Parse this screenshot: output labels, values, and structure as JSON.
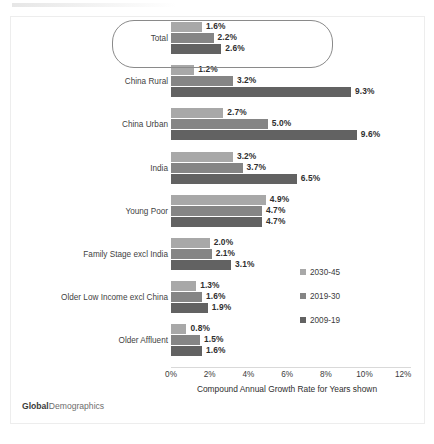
{
  "brand": {
    "part1": "Global",
    "part2": "Demographics"
  },
  "legend": {
    "position": "right-middle",
    "items": [
      {
        "label": "2030-45",
        "color": "#a8a8a8",
        "key": "s2030"
      },
      {
        "label": "2019-30",
        "color": "#858585",
        "key": "s2019"
      },
      {
        "label": "2009-19",
        "color": "#626262",
        "key": "s2009"
      }
    ]
  },
  "axis": {
    "title": "Compound Annual Growth Rate for Years shown",
    "ticks": [
      "0%",
      "2%",
      "4%",
      "6%",
      "8%",
      "10%",
      "12%"
    ]
  },
  "highlight": {
    "category": "Total",
    "shape": "rounded-rectangle"
  },
  "chart_data": {
    "type": "bar",
    "orientation": "horizontal",
    "title": "",
    "subtitle": "",
    "xlabel": "Compound Annual Growth Rate for Years shown",
    "ylabel": "",
    "xlim": [
      0,
      12
    ],
    "xunit": "%",
    "xticks": [
      0,
      2,
      4,
      6,
      8,
      10,
      12
    ],
    "grid": false,
    "legend_position": "right",
    "categories": [
      "Total",
      "China Rural",
      "China Urban",
      "India",
      "Young Poor",
      "Family Stage  excl India",
      "Older Low Income excl China",
      "Older Affluent"
    ],
    "series": [
      {
        "name": "2030-45",
        "color": "#a8a8a8",
        "values": [
          1.6,
          1.2,
          2.7,
          3.2,
          4.9,
          2.0,
          1.3,
          0.8
        ],
        "labels": [
          "1.6%",
          "1.2%",
          "2.7%",
          "3.2%",
          "4.9%",
          "2.0%",
          "1.3%",
          "0.8%"
        ]
      },
      {
        "name": "2019-30",
        "color": "#858585",
        "values": [
          2.2,
          3.2,
          5.0,
          3.7,
          4.7,
          2.1,
          1.6,
          1.5
        ],
        "labels": [
          "2.2%",
          "3.2%",
          "5.0%",
          "3.7%",
          "4.7%",
          "2.1%",
          "1.6%",
          "1.5%"
        ]
      },
      {
        "name": "2009-19",
        "color": "#626262",
        "values": [
          2.6,
          9.3,
          9.6,
          6.5,
          4.7,
          3.1,
          1.9,
          1.6
        ],
        "labels": [
          "2.6%",
          "9.3%",
          "9.6%",
          "6.5%",
          "4.7%",
          "3.1%",
          "1.9%",
          "1.6%"
        ]
      }
    ]
  }
}
